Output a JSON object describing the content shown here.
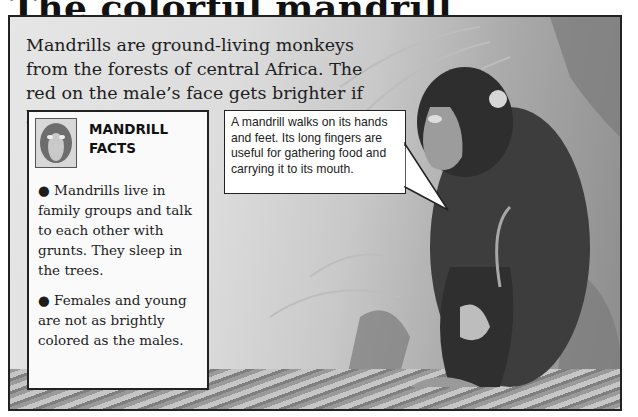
{
  "page": {
    "title": "The colorful mandrill"
  },
  "intro": {
    "text": "Mandrills are ground-living monkeys from the forests of central Africa. The red on the male’s face gets brighter if he becomes angry."
  },
  "facts_box": {
    "icon": "mandrill-face-icon",
    "heading_line1": "MANDRILL",
    "heading_line2": "FACTS",
    "items": [
      {
        "bullet": "●",
        "text": "Mandrills live in family groups and talk to each other with grunts. They sleep in the trees."
      },
      {
        "bullet": "●",
        "text": "Females and young are not as brightly colored as the males."
      }
    ]
  },
  "callout": {
    "text": "A mandrill walks on its hands and feet. Its long fingers are useful for gathering food and carrying it to its mouth."
  },
  "illustration": {
    "subject": "Sitting mandrill in jungle foliage"
  }
}
